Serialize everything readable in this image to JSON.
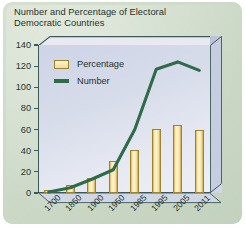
{
  "title": "Number and Percentage of Electoral\nDemocratic Countries",
  "colors": {
    "card_background": "#cbd8c6",
    "plot_background": "#dde2ee",
    "bar_fill": "#f7e9b4",
    "bar_edge": "#9b8330",
    "line": "#2f6b4a",
    "axis": "#3e5a57",
    "text": "#26332d"
  },
  "legend": {
    "position": "top-left-inside",
    "entries": [
      {
        "label": "Percentage",
        "marker": "bar-swatch"
      },
      {
        "label": "Number",
        "marker": "line-swatch"
      }
    ]
  },
  "chart_data": {
    "type": "bar",
    "title": "Number and Percentage of Electoral Democratic Countries",
    "xlabel": "",
    "ylabel": "",
    "ylim": [
      0,
      140
    ],
    "yticks": [
      0,
      20,
      40,
      60,
      80,
      100,
      120,
      140
    ],
    "grid": false,
    "categories": [
      "1700",
      "1850",
      "1900",
      "1950",
      "1985",
      "1995",
      "2005",
      "2011"
    ],
    "series": [
      {
        "name": "Percentage",
        "type": "bar",
        "values": [
          3,
          8,
          14,
          30,
          41,
          61,
          64,
          60
        ]
      },
      {
        "name": "Number",
        "type": "line",
        "values": [
          1,
          5,
          13,
          22,
          60,
          117,
          124,
          116
        ]
      }
    ]
  }
}
